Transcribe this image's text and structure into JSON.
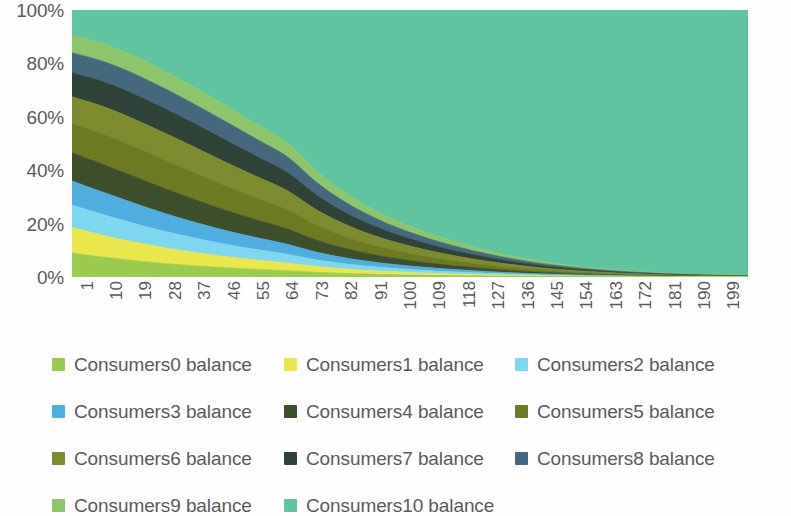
{
  "chart_data": {
    "type": "area",
    "stacked": "percent",
    "title": "",
    "xlabel": "",
    "ylabel": "",
    "ylim": [
      0,
      100
    ],
    "ytick_labels": [
      "0%",
      "20%",
      "40%",
      "60%",
      "80%",
      "100%"
    ],
    "ytick_values": [
      0,
      20,
      40,
      60,
      80,
      100
    ],
    "grid": false,
    "legend_position": "bottom",
    "x": [
      1,
      10,
      19,
      28,
      37,
      46,
      55,
      64,
      73,
      82,
      91,
      100,
      109,
      118,
      127,
      136,
      145,
      154,
      163,
      172,
      181,
      190,
      199
    ],
    "xtick_labels": [
      "1",
      "10",
      "19",
      "28",
      "37",
      "46",
      "55",
      "64",
      "73",
      "82",
      "91",
      "100",
      "109",
      "118",
      "127",
      "136",
      "145",
      "154",
      "163",
      "172",
      "181",
      "190",
      "199"
    ],
    "series": [
      {
        "name": "Consumers0 balance",
        "color": "#9BCB4E",
        "values": [
          9.0,
          8.2,
          7.4,
          6.6,
          5.9,
          5.2,
          4.6,
          4.0,
          3.5,
          3.0,
          2.6,
          2.2,
          1.8,
          1.5,
          1.2,
          0.95,
          0.75,
          0.58,
          0.44,
          0.33,
          0.24,
          0.17,
          0.12
        ]
      },
      {
        "name": "Consumers1 balance",
        "color": "#EAE84B",
        "values": [
          9.5,
          9.0,
          8.4,
          7.7,
          7.0,
          6.3,
          5.6,
          4.9,
          4.3,
          3.7,
          3.2,
          2.7,
          2.3,
          1.9,
          1.5,
          1.2,
          0.95,
          0.72,
          0.54,
          0.4,
          0.29,
          0.21,
          0.15
        ]
      },
      {
        "name": "Consumers2 balance",
        "color": "#7FD8F0",
        "values": [
          8.5,
          8.6,
          8.4,
          8.0,
          7.5,
          6.9,
          6.3,
          5.6,
          4.9,
          4.3,
          3.7,
          3.1,
          2.6,
          2.2,
          1.8,
          1.4,
          1.1,
          0.84,
          0.63,
          0.47,
          0.34,
          0.24,
          0.17
        ]
      },
      {
        "name": "Consumers3 balance",
        "color": "#4FAEE0",
        "values": [
          9.0,
          9.2,
          9.1,
          8.8,
          8.3,
          7.7,
          7.1,
          6.4,
          5.7,
          5.0,
          4.3,
          3.7,
          3.1,
          2.6,
          2.1,
          1.7,
          1.3,
          1.0,
          0.75,
          0.55,
          0.4,
          0.28,
          0.2
        ]
      },
      {
        "name": "Consumers4 balance",
        "color": "#3D4F2A",
        "values": [
          10.5,
          11.5,
          12.0,
          12.1,
          11.9,
          11.4,
          10.7,
          9.8,
          8.9,
          7.9,
          6.9,
          5.9,
          5.0,
          4.2,
          3.4,
          2.7,
          2.1,
          1.6,
          1.2,
          0.88,
          0.63,
          0.45,
          0.32
        ]
      },
      {
        "name": "Consumers5 balance",
        "color": "#6E7A22",
        "values": [
          11.0,
          12.4,
          13.3,
          13.8,
          13.9,
          13.6,
          13.0,
          12.1,
          11.1,
          9.9,
          8.7,
          7.5,
          6.4,
          5.3,
          4.4,
          3.5,
          2.8,
          2.1,
          1.6,
          1.2,
          0.85,
          0.61,
          0.43
        ]
      },
      {
        "name": "Consumers6 balance",
        "color": "#7E8B2E",
        "values": [
          10.0,
          11.4,
          12.5,
          13.2,
          13.5,
          13.4,
          13.0,
          12.3,
          11.4,
          10.3,
          9.1,
          7.9,
          6.8,
          5.7,
          4.7,
          3.8,
          3.0,
          2.3,
          1.8,
          1.3,
          0.94,
          0.68,
          0.48
        ]
      },
      {
        "name": "Consumers7 balance",
        "color": "#2E4238",
        "values": [
          9.0,
          10.2,
          11.2,
          11.9,
          12.3,
          12.4,
          12.1,
          11.6,
          10.9,
          9.9,
          8.9,
          7.7,
          6.6,
          5.6,
          4.6,
          3.8,
          3.0,
          2.3,
          1.8,
          1.3,
          0.96,
          0.69,
          0.49
        ]
      },
      {
        "name": "Consumers8 balance",
        "color": "#45687E",
        "values": [
          7.5,
          8.4,
          9.2,
          9.8,
          10.2,
          10.4,
          10.3,
          10.0,
          9.5,
          8.8,
          7.9,
          7.0,
          6.1,
          5.2,
          4.3,
          3.5,
          2.8,
          2.2,
          1.7,
          1.3,
          0.92,
          0.66,
          0.47
        ]
      },
      {
        "name": "Consumers9 balance",
        "color": "#8DC66B",
        "values": [
          6.5,
          7.3,
          8.0,
          8.5,
          8.9,
          9.1,
          9.1,
          8.9,
          8.5,
          8.0,
          7.3,
          6.5,
          5.7,
          4.9,
          4.1,
          3.4,
          2.7,
          2.1,
          1.7,
          1.3,
          0.93,
          0.67,
          0.48
        ]
      },
      {
        "name": "Consumers10 balance",
        "color": "#5FC5A0",
        "values": [
          9.5,
          13.8,
          20.5,
          29.6,
          40.6,
          53.6,
          68.2,
          84.4,
          121.3,
          159.2,
          196.3,
          230.8,
          265.6,
          301.9,
          339.9,
          379.0,
          418.5,
          457.2,
          494.5,
          530.4,
          564.5,
          596.5,
          626.3
        ]
      }
    ]
  },
  "axes": {
    "y_ticks": [
      "100%",
      "80%",
      "60%",
      "40%",
      "20%",
      "0%"
    ],
    "x_ticks": [
      "1",
      "10",
      "19",
      "28",
      "37",
      "46",
      "55",
      "64",
      "73",
      "82",
      "91",
      "100",
      "109",
      "118",
      "127",
      "136",
      "145",
      "154",
      "163",
      "172",
      "181",
      "190",
      "199"
    ]
  },
  "legend": {
    "items": [
      {
        "label": "Consumers0 balance",
        "color": "#9BCB4E"
      },
      {
        "label": "Consumers1 balance",
        "color": "#EAE84B"
      },
      {
        "label": "Consumers2 balance",
        "color": "#7FD8F0"
      },
      {
        "label": "Consumers3 balance",
        "color": "#4FAEE0"
      },
      {
        "label": "Consumers4 balance",
        "color": "#3D4F2A"
      },
      {
        "label": "Consumers5 balance",
        "color": "#6E7A22"
      },
      {
        "label": "Consumers6 balance",
        "color": "#7E8B2E"
      },
      {
        "label": "Consumers7 balance",
        "color": "#2E4238"
      },
      {
        "label": "Consumers8 balance",
        "color": "#45687E"
      },
      {
        "label": "Consumers9 balance",
        "color": "#8DC66B"
      },
      {
        "label": "Consumers10 balance",
        "color": "#5FC5A0"
      }
    ]
  }
}
